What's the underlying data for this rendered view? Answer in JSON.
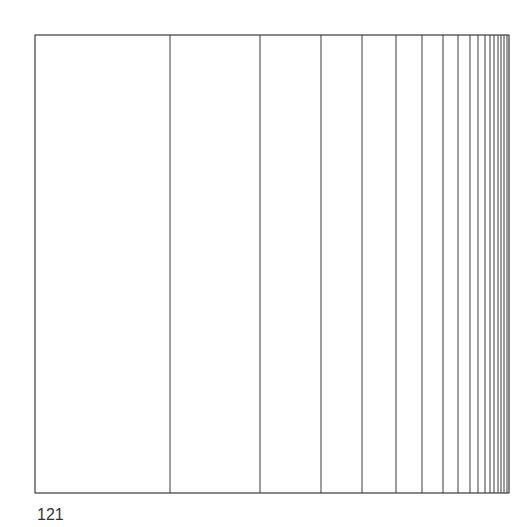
{
  "figure": {
    "frame": {
      "left": 35,
      "top": 35,
      "right": 509,
      "bottom": 493
    },
    "stroke_color": "#3a3a3a",
    "divider_x": [
      170,
      260,
      321,
      362,
      396,
      422,
      443,
      458,
      470,
      478,
      485,
      490,
      494,
      498,
      501,
      504,
      507
    ]
  },
  "page": {
    "number": "121"
  }
}
